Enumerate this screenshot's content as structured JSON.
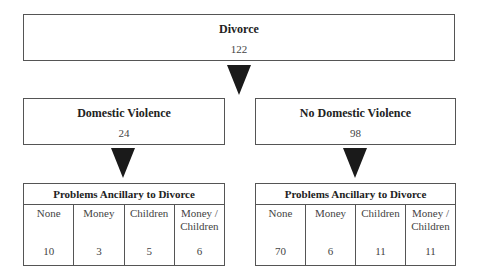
{
  "root": {
    "title": "Divorce",
    "count": "122"
  },
  "branches": [
    {
      "title": "Domestic Violence",
      "count": "24",
      "table": {
        "header": "Problems Ancillary to Divorce",
        "columns": [
          {
            "label": "None",
            "value": "10"
          },
          {
            "label": "Money",
            "value": "3"
          },
          {
            "label": "Children",
            "value": "5"
          },
          {
            "label": "Money / Children",
            "value": "6"
          }
        ]
      }
    },
    {
      "title": "No Domestic Violence",
      "count": "98",
      "table": {
        "header": "Problems Ancillary to Divorce",
        "columns": [
          {
            "label": "None",
            "value": "70"
          },
          {
            "label": "Money",
            "value": "6"
          },
          {
            "label": "Children",
            "value": "11"
          },
          {
            "label": "Money / Children",
            "value": "11"
          }
        ]
      }
    }
  ]
}
